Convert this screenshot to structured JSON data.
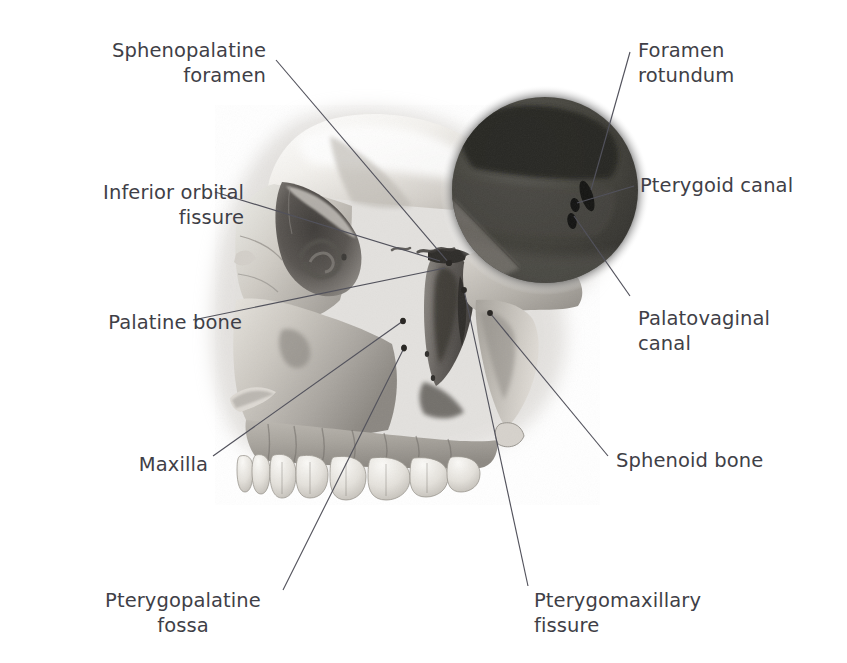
{
  "figure": {
    "background_color": "#ffffff",
    "label_color": "#3f3f47",
    "leader_line_color": "#52525c",
    "bone_light": "#e8e5e0",
    "bone_mid": "#b2aea8",
    "bone_dark": "#6e6a66",
    "inset_dark": "#3a3a3a",
    "tooth_color": "#f0eee9"
  },
  "labels": [
    {
      "id": "sphenopalatine-foramen",
      "lines": [
        "Sphenopalatine",
        "foramen"
      ],
      "text": "Sphenopalatine foramen",
      "align": "right",
      "x": 96,
      "y": 38,
      "width": 170
    },
    {
      "id": "foramen-rotundum",
      "lines": [
        "Foramen",
        "rotundum"
      ],
      "text": "Foramen rotundum",
      "align": "left",
      "x": 638,
      "y": 38,
      "width": 180
    },
    {
      "id": "inferior-orbital-fissure",
      "lines": [
        "Inferior orbital",
        "fissure"
      ],
      "text": "Inferior orbital fissure",
      "align": "right",
      "x": 44,
      "y": 180,
      "width": 200
    },
    {
      "id": "pterygoid-canal",
      "lines": [
        "Pterygoid canal"
      ],
      "text": "Pterygoid canal",
      "align": "left",
      "x": 640,
      "y": 173,
      "width": 180
    },
    {
      "id": "palatine-bone",
      "lines": [
        "Palatine bone"
      ],
      "text": "Palatine bone",
      "align": "right",
      "x": 42,
      "y": 310,
      "width": 200
    },
    {
      "id": "palatovaginal-canal",
      "lines": [
        "Palatovaginal",
        "canal"
      ],
      "text": "Palatovaginal canal",
      "align": "left",
      "x": 638,
      "y": 306,
      "width": 180
    },
    {
      "id": "maxilla",
      "lines": [
        "Maxilla"
      ],
      "text": "Maxilla",
      "align": "right",
      "x": 60,
      "y": 452,
      "width": 148
    },
    {
      "id": "sphenoid-bone",
      "lines": [
        "Sphenoid bone"
      ],
      "text": "Sphenoid bone",
      "align": "left",
      "x": 616,
      "y": 448,
      "width": 190
    },
    {
      "id": "pterygopalatine-fossa",
      "lines": [
        "Pterygopalatine",
        "fossa"
      ],
      "text": "Pterygopalatine fossa",
      "align": "center",
      "x": 88,
      "y": 588,
      "width": 190
    },
    {
      "id": "pterygomaxillary-fissure",
      "lines": [
        "Pterygomaxillary",
        "fissure"
      ],
      "text": "Pterygomaxillary fissure",
      "align": "left",
      "x": 534,
      "y": 588,
      "width": 200
    }
  ],
  "leaders": [
    {
      "id": "leader-sphenopalatine-foramen",
      "x1": 276,
      "y1": 60,
      "x2": 449,
      "y2": 263,
      "dot": true
    },
    {
      "id": "leader-foramen-rotundum",
      "x1": 630,
      "y1": 52,
      "x2": 591,
      "y2": 190,
      "dot": false
    },
    {
      "id": "leader-inferior-orbital-fissure",
      "x1": 215,
      "y1": 192,
      "x2": 440,
      "y2": 261,
      "dot": false
    },
    {
      "id": "leader-pterygoid-canal",
      "x1": 634,
      "y1": 186,
      "x2": 577,
      "y2": 203,
      "dot": false
    },
    {
      "id": "leader-palatine-bone",
      "x1": 193,
      "y1": 320,
      "x2": 445,
      "y2": 268,
      "dot": false
    },
    {
      "id": "leader-palatovaginal-canal",
      "x1": 630,
      "y1": 296,
      "x2": 574,
      "y2": 216,
      "dot": false
    },
    {
      "id": "leader-maxilla",
      "x1": 213,
      "y1": 456,
      "x2": 403,
      "y2": 321,
      "dot": true
    },
    {
      "id": "leader-sphenoid-bone",
      "x1": 608,
      "y1": 456,
      "x2": 490,
      "y2": 313,
      "dot": true
    },
    {
      "id": "leader-pterygopalatine-fossa",
      "x1": 283,
      "y1": 590,
      "x2": 404,
      "y2": 348,
      "dot": true
    },
    {
      "id": "leader-pterygomaxillary-fissure",
      "x1": 528,
      "y1": 586,
      "x2": 464,
      "y2": 290,
      "dot": true
    }
  ],
  "inset": {
    "id": "magnifier-circle",
    "cx": 545,
    "cy": 190,
    "r": 93,
    "foramina": [
      {
        "id": "foramen-rotundum-opening",
        "cx": 587,
        "cy": 196,
        "rx": 6,
        "ry": 16,
        "rot": -18
      },
      {
        "id": "pterygoid-canal-opening",
        "cx": 575,
        "cy": 205,
        "rx": 4.5,
        "ry": 7,
        "rot": -10
      },
      {
        "id": "palatovaginal-canal-opening",
        "cx": 572,
        "cy": 220,
        "rx": 4.5,
        "ry": 8,
        "rot": -10
      }
    ]
  }
}
